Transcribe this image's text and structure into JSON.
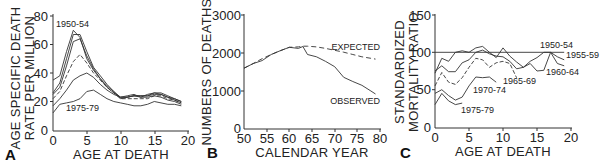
{
  "panels": {
    "a": {
      "label": "A",
      "ylabel1": "AGE SPECIFIC DEATH",
      "ylabel2": "RATE PER MILLION",
      "xlabel": "AGE AT DEATH",
      "yticks": [
        "0",
        "20",
        "40",
        "60",
        "80"
      ],
      "xticks": [
        "0",
        "5",
        "10",
        "15",
        "20"
      ],
      "ann_top": "1950-54",
      "ann_bottom": "1975-79"
    },
    "b": {
      "label": "B",
      "ylabel": "NUMBERS OF DEATHS",
      "xlabel": "CALENDAR YEAR",
      "yticks": [
        "0",
        "1000",
        "2000",
        "3000"
      ],
      "xticks": [
        "50",
        "55",
        "60",
        "65",
        "70",
        "75",
        "80"
      ],
      "ann_expected": "EXPECTED",
      "ann_observed": "OBSERVED"
    },
    "c": {
      "label": "C",
      "ylabel1": "STANDARDIZED",
      "ylabel2": "MORTALITY RATIO",
      "xlabel": "AGE AT DEATH",
      "yticks": [
        "0",
        "50",
        "100",
        "150"
      ],
      "xticks": [
        "0",
        "5",
        "10",
        "15",
        "20"
      ],
      "ann": [
        "1950-54",
        "1955-59",
        "1960-64",
        "1965-69",
        "1970-74",
        "1975-79"
      ]
    }
  },
  "chart_data": [
    {
      "type": "line",
      "title": "A",
      "xlabel": "AGE AT DEATH",
      "ylabel": "AGE SPECIFIC DEATH RATE PER MILLION",
      "xlim": [
        0,
        20
      ],
      "ylim": [
        0,
        80
      ],
      "x": [
        0,
        1,
        2,
        3,
        4,
        5,
        6,
        7,
        8,
        9,
        10,
        11,
        12,
        13,
        14,
        15,
        16,
        17,
        18,
        19
      ],
      "series": [
        {
          "name": "1950-54",
          "values": [
            35,
            38,
            55,
            70,
            65,
            50,
            42,
            36,
            30,
            26,
            23,
            23,
            24,
            24,
            24,
            26,
            25,
            23,
            22,
            20
          ]
        },
        {
          "name": "1955-59",
          "values": [
            26,
            33,
            50,
            67,
            67,
            55,
            44,
            38,
            32,
            27,
            23,
            23,
            24,
            23,
            25,
            26,
            26,
            24,
            22,
            20
          ]
        },
        {
          "name": "1960-64",
          "values": [
            25,
            30,
            45,
            62,
            64,
            52,
            43,
            36,
            31,
            27,
            22,
            23,
            24,
            24,
            24,
            25,
            25,
            23,
            21,
            19
          ]
        },
        {
          "name": "1965-69",
          "values": [
            22,
            27,
            38,
            48,
            53,
            47,
            40,
            35,
            30,
            26,
            22,
            22,
            22,
            22,
            22,
            24,
            24,
            22,
            21,
            19
          ]
        },
        {
          "name": "1970-74",
          "values": [
            17,
            22,
            28,
            35,
            38,
            40,
            37,
            32,
            28,
            25,
            23,
            24,
            25,
            23,
            23,
            24,
            23,
            21,
            20,
            18
          ]
        },
        {
          "name": "1975-79",
          "values": [
            12,
            18,
            19,
            20,
            22,
            27,
            28,
            25,
            22,
            20,
            19,
            18,
            17,
            17,
            18,
            20,
            19,
            18,
            18,
            17
          ]
        }
      ]
    },
    {
      "type": "line",
      "title": "B",
      "xlabel": "CALENDAR YEAR",
      "ylabel": "NUMBERS OF DEATHS",
      "xlim": [
        50,
        80
      ],
      "ylim": [
        0,
        3000
      ],
      "x": [
        50,
        52,
        54,
        56,
        58,
        60,
        62,
        63,
        64,
        66,
        68,
        70,
        72,
        74,
        76,
        78,
        79
      ],
      "series": [
        {
          "name": "EXPECTED",
          "values": [
            1600,
            1720,
            1850,
            1960,
            2060,
            2150,
            2160,
            2180,
            2180,
            2160,
            2120,
            2070,
            2020,
            1960,
            1900,
            1860,
            1840
          ]
        },
        {
          "name": "OBSERVED",
          "values": [
            1600,
            1720,
            1800,
            1960,
            2060,
            2150,
            2120,
            2170,
            1960,
            1900,
            1780,
            1640,
            1360,
            1250,
            1150,
            1000,
            920
          ]
        }
      ]
    },
    {
      "type": "line",
      "title": "C",
      "xlabel": "AGE AT DEATH",
      "ylabel": "STANDARDIZED MORTALITY RATIO",
      "xlim": [
        0,
        20
      ],
      "ylim": [
        0,
        150
      ],
      "reference_line": 100,
      "series": [
        {
          "name": "1950-54",
          "x": [
            0,
            19
          ],
          "values": [
            100,
            100
          ]
        },
        {
          "name": "1955-59",
          "x": [
            0,
            1,
            2,
            3,
            4,
            5,
            6,
            7,
            8,
            9,
            10,
            11,
            12,
            13,
            14,
            15,
            16,
            17,
            18,
            19
          ],
          "values": [
            72,
            92,
            88,
            100,
            102,
            100,
            106,
            108,
            100,
            93,
            106,
            95,
            87,
            80,
            88,
            93,
            100,
            100,
            94,
            90
          ]
        },
        {
          "name": "1960-64",
          "x": [
            0,
            1,
            2,
            3,
            4,
            5,
            6,
            7,
            8,
            9,
            10,
            11,
            12,
            13,
            14,
            15,
            16,
            17,
            18,
            19
          ],
          "values": [
            75,
            82,
            74,
            74,
            86,
            90,
            100,
            103,
            98,
            95,
            94,
            88,
            78,
            80,
            85,
            75,
            76,
            100,
            85,
            82
          ]
        },
        {
          "name": "1965-69",
          "x": [
            0,
            1,
            2,
            3,
            4,
            5,
            6,
            7,
            8,
            9,
            10,
            11,
            12
          ],
          "values": [
            55,
            73,
            60,
            57,
            66,
            80,
            92,
            90,
            80,
            86,
            88,
            85,
            66
          ]
        },
        {
          "name": "1970-74",
          "x": [
            0,
            1,
            2,
            3,
            4,
            5,
            6,
            7,
            8,
            9
          ],
          "values": [
            45,
            50,
            42,
            36,
            40,
            55,
            67,
            66,
            67,
            60
          ]
        },
        {
          "name": "1975-79",
          "x": [
            0,
            1,
            2,
            3,
            4
          ],
          "values": [
            30,
            45,
            35,
            30,
            32
          ]
        }
      ]
    }
  ]
}
